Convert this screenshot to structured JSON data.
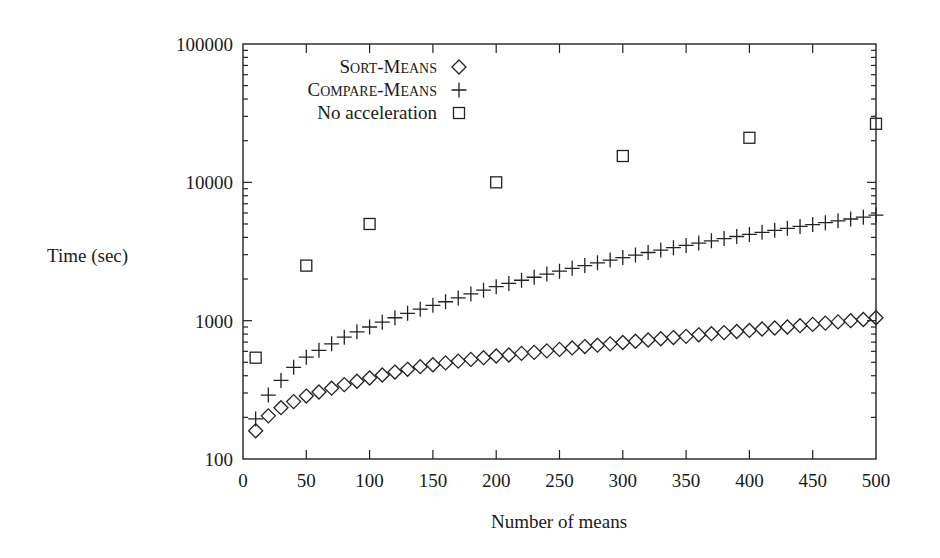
{
  "chart_data": {
    "type": "scatter",
    "title": "",
    "xlabel": "Number of means",
    "ylabel": "Time (sec)",
    "xlim": [
      0,
      500
    ],
    "ylim": [
      100,
      100000
    ],
    "yscale": "log",
    "grid": false,
    "legend_position": "upper-left (inside)",
    "x_ticks": [
      0,
      50,
      100,
      150,
      200,
      250,
      300,
      350,
      400,
      450,
      500
    ],
    "y_ticks": [
      100,
      1000,
      10000,
      100000
    ],
    "x_tick_labels": [
      "0",
      "50",
      "100",
      "150",
      "200",
      "250",
      "300",
      "350",
      "400",
      "450",
      "500"
    ],
    "y_tick_labels": [
      "100",
      "1000",
      "10000",
      "100000"
    ],
    "series": [
      {
        "name": "Sort-means",
        "display_name": "SORT-MEANS",
        "marker": "diamond",
        "x": [
          10,
          20,
          30,
          40,
          50,
          60,
          70,
          80,
          90,
          100,
          110,
          120,
          130,
          140,
          150,
          160,
          170,
          180,
          190,
          200,
          210,
          220,
          230,
          240,
          250,
          260,
          270,
          280,
          290,
          300,
          310,
          320,
          330,
          340,
          350,
          360,
          370,
          380,
          390,
          400,
          410,
          420,
          430,
          440,
          450,
          460,
          470,
          480,
          490,
          500
        ],
        "values": [
          160,
          205,
          235,
          260,
          285,
          305,
          325,
          345,
          365,
          385,
          405,
          425,
          445,
          465,
          480,
          495,
          510,
          525,
          540,
          555,
          565,
          580,
          590,
          605,
          620,
          635,
          650,
          665,
          680,
          695,
          710,
          725,
          740,
          755,
          770,
          790,
          805,
          820,
          835,
          850,
          870,
          885,
          900,
          920,
          940,
          960,
          980,
          1000,
          1020,
          1050
        ]
      },
      {
        "name": "Compare-means",
        "display_name": "COMPARE-MEANS",
        "marker": "plus",
        "x": [
          10,
          20,
          30,
          40,
          50,
          60,
          70,
          80,
          90,
          100,
          110,
          120,
          130,
          140,
          150,
          160,
          170,
          180,
          190,
          200,
          210,
          220,
          230,
          240,
          250,
          260,
          270,
          280,
          290,
          300,
          310,
          320,
          330,
          340,
          350,
          360,
          370,
          380,
          390,
          400,
          410,
          420,
          430,
          440,
          450,
          460,
          470,
          480,
          490,
          500
        ],
        "values": [
          195,
          290,
          370,
          460,
          545,
          610,
          680,
          760,
          830,
          900,
          975,
          1050,
          1130,
          1210,
          1290,
          1370,
          1460,
          1560,
          1660,
          1760,
          1860,
          1960,
          2060,
          2170,
          2280,
          2390,
          2500,
          2620,
          2740,
          2860,
          2980,
          3110,
          3240,
          3370,
          3500,
          3640,
          3780,
          3920,
          4060,
          4200,
          4350,
          4500,
          4650,
          4800,
          4950,
          5110,
          5270,
          5430,
          5600,
          5800
        ]
      },
      {
        "name": "No acceleration",
        "display_name": "No acceleration",
        "marker": "square",
        "x": [
          10,
          50,
          100,
          200,
          300,
          400,
          500
        ],
        "values": [
          540,
          2500,
          5000,
          10000,
          15500,
          21000,
          26500
        ]
      }
    ]
  }
}
